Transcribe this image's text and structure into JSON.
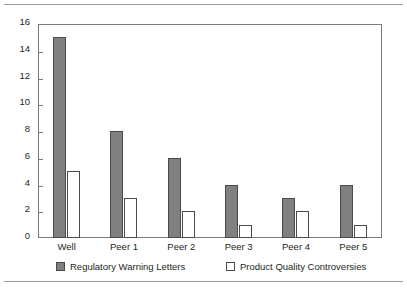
{
  "page": {
    "clipped_header_text": "",
    "rule_color": "#9a9a9a"
  },
  "chart_data": {
    "type": "bar",
    "title": "",
    "subtitle": "",
    "xlabel": "",
    "ylabel": "",
    "categories": [
      "Well",
      "Peer 1",
      "Peer 2",
      "Peer 3",
      "Peer 4",
      "Peer 5"
    ],
    "series": [
      {
        "name": "Regulatory Warning Letters",
        "values": [
          15,
          8,
          6,
          4,
          3,
          4
        ],
        "color": "#808080",
        "border_color": "#4a4a4a"
      },
      {
        "name": "Product Quality Controversies",
        "values": [
          5,
          3,
          2,
          1,
          2,
          1
        ],
        "color": "#FFFFFF",
        "border_color": "#4a4a4a"
      }
    ],
    "ylim": [
      0,
      16
    ],
    "ytick_step": 2,
    "yticks": [
      0,
      2,
      4,
      6,
      8,
      10,
      12,
      14,
      16
    ],
    "ytick_labels": [
      "0",
      "2",
      "4",
      "6",
      "8",
      "10",
      "12",
      "14",
      "16"
    ],
    "grid": false,
    "frame": true,
    "legend_position": "bottom",
    "legend": [
      "Regulatory Warning Letters",
      "Product Quality Controversies"
    ]
  }
}
